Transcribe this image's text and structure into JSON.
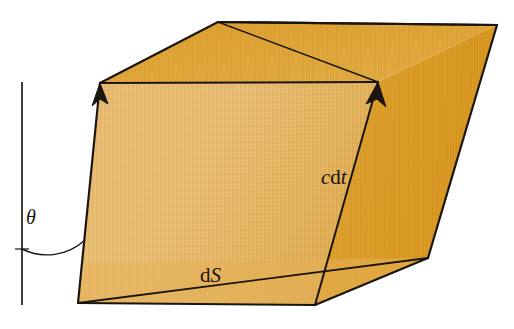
{
  "figure": {
    "background_color": "#ffffff",
    "stroke_color": "#1b1510",
    "faces": {
      "front_color": "#e8b563",
      "front_color_light": "#edc277",
      "top_color": "#e0a030",
      "right_color": "#dd9c27",
      "lower_front_color": "#e3ab4a"
    },
    "axis_line_color": "#3a3430"
  },
  "labels": {
    "theta": "θ",
    "ds_prefix": "d",
    "ds_symbol": "S",
    "cdt_c": "c",
    "cdt_d": "d",
    "cdt_t": "t"
  },
  "annotations": {
    "theta_name": "angle-theta",
    "ds_name": "area-element-dS",
    "cdt_name": "length-cdt",
    "normal_axis_name": "vertical-reference-axis",
    "arrow_left_name": "slant-edge-arrow-left",
    "arrow_right_name": "slant-edge-arrow-cdt"
  },
  "geometry": {
    "bottom_left_vertex": [
      78,
      303
    ],
    "top_left_vertex": [
      100,
      83
    ],
    "top_apex_vertex": [
      218,
      22
    ],
    "top_right_vertex": [
      497,
      25
    ],
    "right_mid_vertex": [
      378,
      82
    ],
    "bottom_right_vertex": [
      428,
      258
    ],
    "front_bottom_vertex": [
      315,
      305
    ],
    "left_mid_vertex": [
      85,
      298
    ],
    "axis_top": [
      22,
      82
    ],
    "axis_bottom": [
      22,
      305
    ]
  },
  "colors": {
    "ink": "#1b1510",
    "paper": "#ffffff",
    "accent_orange": "#e4a838"
  }
}
